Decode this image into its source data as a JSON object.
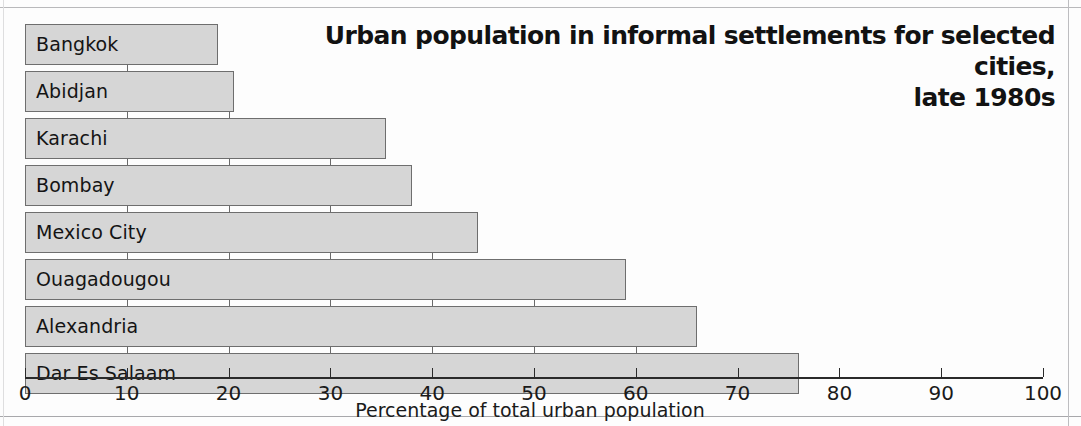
{
  "chart_data": {
    "type": "bar",
    "orientation": "horizontal",
    "title": "Urban population in informal settlements for selected cities, late 1980s",
    "title_line1": "Urban population in informal settlements for selected cities,",
    "title_line2": "late 1980s",
    "xlabel": "Percentage of total urban population",
    "ylabel": "",
    "xlim": [
      0,
      100
    ],
    "xticks": [
      0,
      10,
      20,
      30,
      40,
      50,
      60,
      70,
      80,
      90,
      100
    ],
    "xtick_labels": [
      "0",
      "10",
      "20",
      "30",
      "40",
      "50",
      "60",
      "70",
      "80",
      "90",
      "100"
    ],
    "grid": false,
    "legend": "none",
    "categories": [
      "Bangkok",
      "Abidjan",
      "Karachi",
      "Bombay",
      "Mexico City",
      "Ouagadougou",
      "Alexandria",
      "Dar Es Salaam"
    ],
    "values": [
      19,
      20.5,
      35.5,
      38,
      44.5,
      59,
      66,
      76
    ],
    "series": [
      {
        "name": "Percentage of total urban population",
        "values": [
          19,
          20.5,
          35.5,
          38,
          44.5,
          59,
          66,
          76
        ]
      }
    ],
    "bars": [
      {
        "label": "Bangkok",
        "value": 19
      },
      {
        "label": "Abidjan",
        "value": 20.5
      },
      {
        "label": "Karachi",
        "value": 35.5
      },
      {
        "label": "Bombay",
        "value": 38
      },
      {
        "label": "Mexico City",
        "value": 44.5
      },
      {
        "label": "Ouagadougou",
        "value": 59
      },
      {
        "label": "Alexandria",
        "value": 66
      },
      {
        "label": "Dar Es Salaam",
        "value": 76
      }
    ],
    "colors": {
      "bar_fill": "#d6d6d6",
      "bar_stroke": "#6e6e6e",
      "axis": "#2a2a2a",
      "text": "#141414",
      "background": "#fdfdfd"
    }
  }
}
